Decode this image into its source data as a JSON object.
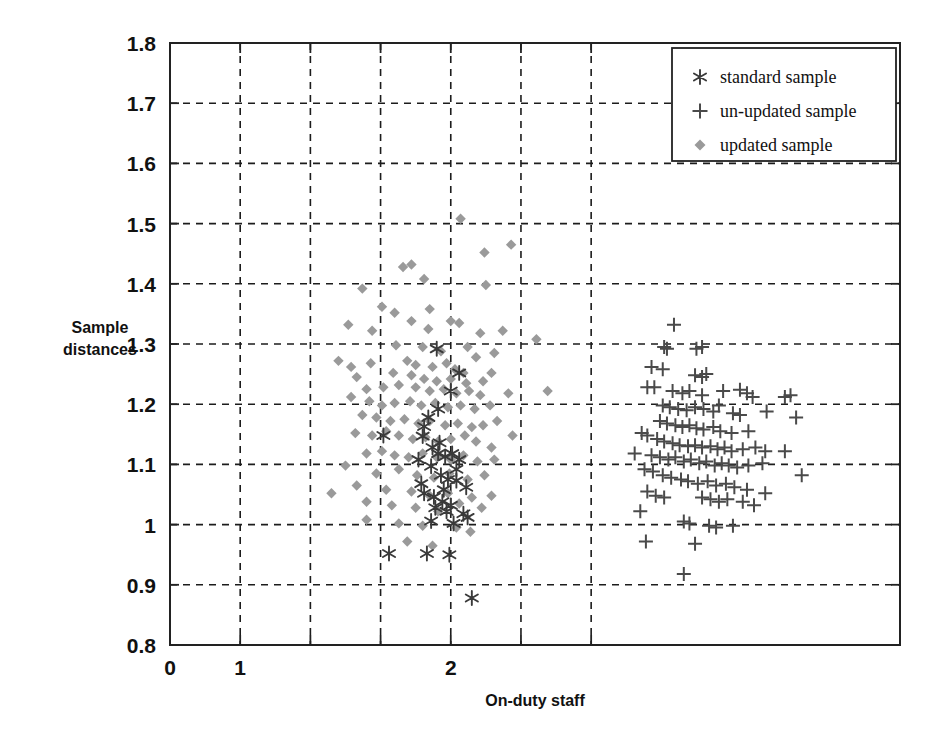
{
  "chart_data": {
    "type": "scatter",
    "title": "",
    "xlabel": "On-duty staff",
    "ylabel": "Sample distances",
    "xlim": [
      0,
      2.6
    ],
    "ylim": [
      0.8,
      1.8
    ],
    "grid": true,
    "x_ticks": [
      0,
      0.25,
      0.5,
      0.75,
      1.0,
      1.25,
      1.5
    ],
    "x_tick_labels": [
      "0",
      "1",
      "",
      "",
      "2",
      "",
      ""
    ],
    "x_tick_labels_shown": [
      "0",
      "1",
      "2"
    ],
    "y_ticks": [
      0.8,
      0.9,
      1.0,
      1.1,
      1.2,
      1.3,
      1.4,
      1.5,
      1.6,
      1.7,
      1.8
    ],
    "y_tick_labels": [
      "0.8",
      "0.9",
      "1",
      "1.1",
      "1.2",
      "1.3",
      "1.4",
      "1.5",
      "1.6",
      "1.7",
      "1.8"
    ],
    "legend_position": "top-right",
    "series": [
      {
        "name": "standard sample",
        "marker": "asterisk",
        "color": "#3a3a3a",
        "points": [
          [
            0.95,
            1.292
          ],
          [
            1.03,
            1.252
          ],
          [
            0.92,
            1.178
          ],
          [
            0.905,
            1.163
          ],
          [
            0.9,
            1.147
          ],
          [
            0.935,
            1.128
          ],
          [
            0.955,
            1.118
          ],
          [
            0.98,
            1.113
          ],
          [
            1.005,
            1.118
          ],
          [
            0.885,
            1.108
          ],
          [
            0.76,
            1.148
          ],
          [
            0.93,
            1.097
          ],
          [
            0.965,
            1.082
          ],
          [
            0.99,
            1.075
          ],
          [
            1.02,
            1.073
          ],
          [
            1.055,
            1.062
          ],
          [
            0.905,
            1.052
          ],
          [
            0.94,
            1.046
          ],
          [
            0.97,
            1.038
          ],
          [
            1.0,
            1.032
          ],
          [
            0.945,
            1.028
          ],
          [
            0.985,
            1.022
          ],
          [
            1.045,
            1.018
          ],
          [
            1.06,
            1.012
          ],
          [
            0.78,
            0.952
          ],
          [
            0.915,
            0.952
          ],
          [
            0.995,
            0.95
          ],
          [
            1.075,
            0.878
          ],
          [
            0.93,
            1.006
          ],
          [
            1.01,
            1.002
          ],
          [
            0.895,
            1.068
          ],
          [
            0.96,
            1.136
          ],
          [
            1.03,
            1.108
          ],
          [
            0.955,
            1.192
          ],
          [
            1.0,
            1.222
          ],
          [
            0.975,
            1.058
          ],
          [
            1.02,
            1.092
          ]
        ]
      },
      {
        "name": "un-updated sample",
        "marker": "plus",
        "color": "#4a4a4a",
        "points": [
          [
            1.795,
            1.332
          ],
          [
            1.76,
            1.295
          ],
          [
            1.77,
            1.292
          ],
          [
            1.875,
            1.292
          ],
          [
            1.895,
            1.295
          ],
          [
            1.715,
            1.262
          ],
          [
            1.755,
            1.258
          ],
          [
            1.87,
            1.248
          ],
          [
            1.895,
            1.245
          ],
          [
            1.91,
            1.25
          ],
          [
            1.725,
            1.228
          ],
          [
            1.7,
            1.228
          ],
          [
            1.79,
            1.222
          ],
          [
            1.825,
            1.218
          ],
          [
            1.85,
            1.222
          ],
          [
            1.895,
            1.215
          ],
          [
            1.97,
            1.222
          ],
          [
            2.03,
            1.224
          ],
          [
            2.055,
            1.218
          ],
          [
            2.075,
            1.212
          ],
          [
            2.19,
            1.212
          ],
          [
            2.21,
            1.215
          ],
          [
            1.755,
            1.198
          ],
          [
            1.78,
            1.195
          ],
          [
            1.81,
            1.192
          ],
          [
            1.84,
            1.19
          ],
          [
            1.87,
            1.195
          ],
          [
            1.9,
            1.192
          ],
          [
            1.935,
            1.188
          ],
          [
            1.955,
            1.198
          ],
          [
            2.005,
            1.185
          ],
          [
            2.03,
            1.182
          ],
          [
            2.125,
            1.188
          ],
          [
            1.745,
            1.172
          ],
          [
            1.77,
            1.168
          ],
          [
            1.8,
            1.165
          ],
          [
            1.825,
            1.162
          ],
          [
            1.85,
            1.165
          ],
          [
            1.875,
            1.16
          ],
          [
            1.9,
            1.158
          ],
          [
            1.935,
            1.162
          ],
          [
            1.96,
            1.155
          ],
          [
            2.0,
            1.152
          ],
          [
            2.06,
            1.155
          ],
          [
            2.23,
            1.178
          ],
          [
            1.68,
            1.152
          ],
          [
            1.7,
            1.148
          ],
          [
            1.735,
            1.142
          ],
          [
            1.76,
            1.138
          ],
          [
            1.79,
            1.135
          ],
          [
            1.815,
            1.132
          ],
          [
            1.845,
            1.13
          ],
          [
            1.87,
            1.132
          ],
          [
            1.895,
            1.128
          ],
          [
            1.925,
            1.13
          ],
          [
            1.95,
            1.125
          ],
          [
            1.975,
            1.128
          ],
          [
            2.0,
            1.122
          ],
          [
            2.04,
            1.125
          ],
          [
            2.085,
            1.128
          ],
          [
            2.12,
            1.122
          ],
          [
            1.715,
            1.115
          ],
          [
            1.745,
            1.112
          ],
          [
            1.775,
            1.108
          ],
          [
            1.8,
            1.112
          ],
          [
            1.83,
            1.105
          ],
          [
            1.855,
            1.108
          ],
          [
            1.885,
            1.102
          ],
          [
            1.91,
            1.105
          ],
          [
            1.94,
            1.098
          ],
          [
            1.965,
            1.102
          ],
          [
            1.99,
            1.098
          ],
          [
            2.02,
            1.095
          ],
          [
            2.06,
            1.098
          ],
          [
            2.11,
            1.102
          ],
          [
            2.19,
            1.122
          ],
          [
            2.25,
            1.082
          ],
          [
            1.655,
            1.118
          ],
          [
            1.69,
            1.092
          ],
          [
            1.72,
            1.088
          ],
          [
            1.755,
            1.082
          ],
          [
            1.785,
            1.078
          ],
          [
            1.82,
            1.075
          ],
          [
            1.845,
            1.072
          ],
          [
            1.88,
            1.068
          ],
          [
            1.915,
            1.072
          ],
          [
            1.945,
            1.065
          ],
          [
            1.98,
            1.068
          ],
          [
            2.01,
            1.062
          ],
          [
            2.055,
            1.058
          ],
          [
            2.12,
            1.052
          ],
          [
            1.7,
            1.055
          ],
          [
            1.73,
            1.048
          ],
          [
            1.76,
            1.045
          ],
          [
            1.895,
            1.045
          ],
          [
            1.925,
            1.042
          ],
          [
            1.955,
            1.038
          ],
          [
            1.985,
            1.042
          ],
          [
            2.04,
            1.038
          ],
          [
            2.08,
            1.032
          ],
          [
            1.675,
            1.022
          ],
          [
            1.83,
            1.005
          ],
          [
            1.85,
            1.002
          ],
          [
            1.92,
            0.998
          ],
          [
            1.945,
            0.995
          ],
          [
            2.005,
            0.998
          ],
          [
            1.695,
            0.972
          ],
          [
            1.87,
            0.968
          ],
          [
            1.83,
            0.918
          ]
        ]
      },
      {
        "name": "updated sample",
        "marker": "diamond",
        "color": "#9a9a9a",
        "points": [
          [
            1.035,
            1.508
          ],
          [
            1.12,
            1.452
          ],
          [
            1.215,
            1.465
          ],
          [
            0.83,
            1.428
          ],
          [
            0.905,
            1.408
          ],
          [
            1.125,
            1.398
          ],
          [
            0.685,
            1.392
          ],
          [
            0.86,
            1.432
          ],
          [
            0.755,
            1.362
          ],
          [
            0.8,
            1.352
          ],
          [
            0.925,
            1.358
          ],
          [
            0.86,
            1.338
          ],
          [
            0.635,
            1.332
          ],
          [
            0.72,
            1.322
          ],
          [
            0.92,
            1.325
          ],
          [
            1.0,
            1.338
          ],
          [
            1.03,
            1.335
          ],
          [
            1.105,
            1.318
          ],
          [
            1.185,
            1.322
          ],
          [
            1.305,
            1.308
          ],
          [
            0.805,
            1.298
          ],
          [
            0.9,
            1.295
          ],
          [
            0.965,
            1.288
          ],
          [
            1.06,
            1.295
          ],
          [
            1.09,
            1.278
          ],
          [
            1.155,
            1.285
          ],
          [
            0.6,
            1.272
          ],
          [
            0.645,
            1.262
          ],
          [
            0.715,
            1.268
          ],
          [
            0.845,
            1.272
          ],
          [
            0.875,
            1.265
          ],
          [
            0.935,
            1.262
          ],
          [
            0.985,
            1.268
          ],
          [
            1.015,
            1.258
          ],
          [
            1.045,
            1.252
          ],
          [
            0.665,
            1.245
          ],
          [
            0.795,
            1.252
          ],
          [
            0.86,
            1.248
          ],
          [
            0.905,
            1.242
          ],
          [
            0.95,
            1.238
          ],
          [
            1.0,
            1.242
          ],
          [
            1.055,
            1.235
          ],
          [
            1.115,
            1.238
          ],
          [
            1.145,
            1.252
          ],
          [
            1.345,
            1.222
          ],
          [
            0.7,
            1.225
          ],
          [
            0.76,
            1.228
          ],
          [
            0.815,
            1.232
          ],
          [
            0.875,
            1.228
          ],
          [
            0.925,
            1.222
          ],
          [
            0.975,
            1.225
          ],
          [
            1.02,
            1.218
          ],
          [
            1.065,
            1.222
          ],
          [
            1.105,
            1.215
          ],
          [
            1.205,
            1.218
          ],
          [
            0.645,
            1.212
          ],
          [
            0.71,
            1.205
          ],
          [
            0.755,
            1.198
          ],
          [
            0.8,
            1.202
          ],
          [
            0.855,
            1.205
          ],
          [
            0.895,
            1.198
          ],
          [
            0.945,
            1.202
          ],
          [
            0.99,
            1.195
          ],
          [
            1.035,
            1.198
          ],
          [
            1.085,
            1.192
          ],
          [
            1.14,
            1.198
          ],
          [
            0.685,
            1.182
          ],
          [
            0.735,
            1.178
          ],
          [
            0.785,
            1.172
          ],
          [
            0.835,
            1.175
          ],
          [
            0.885,
            1.168
          ],
          [
            0.925,
            1.172
          ],
          [
            0.98,
            1.165
          ],
          [
            1.025,
            1.168
          ],
          [
            1.075,
            1.162
          ],
          [
            1.115,
            1.165
          ],
          [
            1.165,
            1.172
          ],
          [
            0.66,
            1.152
          ],
          [
            0.72,
            1.148
          ],
          [
            0.77,
            1.155
          ],
          [
            0.815,
            1.148
          ],
          [
            0.865,
            1.142
          ],
          [
            0.91,
            1.145
          ],
          [
            0.955,
            1.138
          ],
          [
            1.0,
            1.142
          ],
          [
            1.05,
            1.148
          ],
          [
            1.09,
            1.138
          ],
          [
            1.145,
            1.128
          ],
          [
            1.22,
            1.148
          ],
          [
            0.7,
            1.118
          ],
          [
            0.755,
            1.122
          ],
          [
            0.8,
            1.115
          ],
          [
            0.85,
            1.112
          ],
          [
            0.9,
            1.118
          ],
          [
            0.95,
            1.112
          ],
          [
            1.0,
            1.108
          ],
          [
            1.045,
            1.115
          ],
          [
            1.095,
            1.105
          ],
          [
            1.155,
            1.108
          ],
          [
            0.625,
            1.098
          ],
          [
            0.735,
            1.085
          ],
          [
            0.815,
            1.092
          ],
          [
            0.88,
            1.082
          ],
          [
            0.94,
            1.078
          ],
          [
            0.995,
            1.085
          ],
          [
            1.06,
            1.075
          ],
          [
            1.12,
            1.082
          ],
          [
            0.665,
            1.065
          ],
          [
            0.77,
            1.058
          ],
          [
            0.86,
            1.055
          ],
          [
            0.925,
            1.048
          ],
          [
            0.99,
            1.052
          ],
          [
            1.075,
            1.045
          ],
          [
            1.145,
            1.048
          ],
          [
            0.7,
            1.038
          ],
          [
            0.79,
            1.032
          ],
          [
            0.875,
            1.028
          ],
          [
            0.955,
            1.022
          ],
          [
            1.03,
            1.035
          ],
          [
            1.11,
            1.028
          ],
          [
            0.575,
            1.052
          ],
          [
            0.7,
            1.008
          ],
          [
            0.815,
            1.002
          ],
          [
            0.9,
            0.998
          ],
          [
            1.02,
            0.995
          ],
          [
            1.07,
            0.988
          ],
          [
            0.845,
            0.972
          ],
          [
            0.935,
            0.965
          ]
        ]
      }
    ]
  },
  "legend": {
    "items": [
      {
        "label": "standard sample",
        "marker": "asterisk"
      },
      {
        "label": "un-updated sample",
        "marker": "plus"
      },
      {
        "label": "updated sample",
        "marker": "diamond"
      }
    ]
  },
  "axes": {
    "x_title": "On-duty staff",
    "y_title_line1": "Sample",
    "y_title_line2": "distances"
  },
  "colors": {
    "standard": "#3a3a3a",
    "unupdated": "#4a4a4a",
    "updated": "#9a9a9a",
    "grid": "#1c1c1c",
    "frame": "#222222",
    "background": "#ffffff"
  }
}
